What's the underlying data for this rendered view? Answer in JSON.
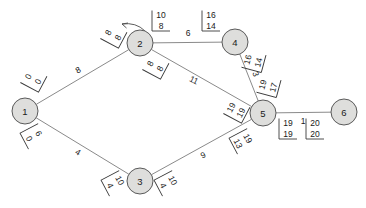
{
  "diagram": {
    "type": "max-flow-network",
    "node_fill": "#dededc",
    "node_stroke": "#5a5a5a",
    "edge_stroke": "#8a8a8a",
    "text_color": "#1a1a1a"
  },
  "nodes": [
    {
      "id": "1",
      "label": "1",
      "x": 25,
      "y": 111,
      "r": 13
    },
    {
      "id": "2",
      "label": "2",
      "x": 140,
      "y": 43,
      "r": 13
    },
    {
      "id": "3",
      "label": "3",
      "x": 140,
      "y": 181,
      "r": 13
    },
    {
      "id": "4",
      "label": "4",
      "x": 235,
      "y": 42,
      "r": 13
    },
    {
      "id": "5",
      "label": "5",
      "x": 263,
      "y": 113,
      "r": 13
    },
    {
      "id": "6",
      "label": "6",
      "x": 344,
      "y": 112,
      "r": 13
    }
  ],
  "edges": [
    {
      "from": "1",
      "to": "2",
      "weight": "8",
      "weight_x": 78,
      "weight_y": 70,
      "weight_rot": -30
    },
    {
      "from": "1",
      "to": "3",
      "weight": "4",
      "weight_x": 78,
      "weight_y": 152,
      "weight_rot": 30
    },
    {
      "from": "2",
      "to": "4",
      "weight": "6",
      "weight_x": 188,
      "weight_y": 33,
      "weight_rot": 0
    },
    {
      "from": "2",
      "to": "5",
      "weight": "11",
      "weight_x": 194,
      "weight_y": 80,
      "weight_rot": 27
    },
    {
      "from": "3",
      "to": "5",
      "weight": "9",
      "weight_x": 203,
      "weight_y": 155,
      "weight_rot": -26
    },
    {
      "from": "4",
      "to": "5",
      "weight": "3",
      "weight_x": 256,
      "weight_y": 74,
      "weight_rot": 70
    },
    {
      "from": "5",
      "to": "6",
      "weight": "1",
      "weight_x": 303,
      "weight_y": 121,
      "weight_rot": 0
    }
  ],
  "flow_labels": [
    {
      "id": "n1-e12",
      "capacity": "0",
      "flow": "0",
      "x": 33,
      "y": 79,
      "rot": -62
    },
    {
      "id": "n2-e12",
      "capacity": "8",
      "flow": "8",
      "x": 113,
      "y": 35,
      "rot": -62
    },
    {
      "id": "n2-e24",
      "capacity": "10",
      "flow": "8",
      "x": 161,
      "y": 20,
      "rot": 0
    },
    {
      "id": "n4-e24",
      "capacity": "16",
      "flow": "14",
      "x": 211,
      "y": 20,
      "rot": 0
    },
    {
      "id": "n2-e25",
      "capacity": "8",
      "flow": "8",
      "x": 155,
      "y": 66,
      "rot": -62
    },
    {
      "id": "n5-e25",
      "capacity": "19",
      "flow": "19",
      "x": 236,
      "y": 110,
      "rot": -62
    },
    {
      "id": "n4-e45",
      "capacity": "16",
      "flow": "14",
      "x": 253,
      "y": 61,
      "rot": -75
    },
    {
      "id": "n5-e45",
      "capacity": "19",
      "flow": "17",
      "x": 268,
      "y": 86,
      "rot": -75
    },
    {
      "id": "n1-e13",
      "capacity": "6",
      "flow": "0",
      "x": 34,
      "y": 136,
      "rot": 62
    },
    {
      "id": "n3-e13",
      "capacity": "10",
      "flow": "4",
      "x": 115,
      "y": 183,
      "rot": 62
    },
    {
      "id": "n3-e35",
      "capacity": "10",
      "flow": "4",
      "x": 168,
      "y": 183,
      "rot": 62
    },
    {
      "id": "n5-e35",
      "capacity": "19",
      "flow": "13",
      "x": 243,
      "y": 141,
      "rot": 62
    },
    {
      "id": "n5-e56",
      "capacity": "19",
      "flow": "19",
      "x": 288,
      "y": 128,
      "rot": 0
    },
    {
      "id": "n6-e56",
      "capacity": "20",
      "flow": "20",
      "x": 315,
      "y": 128,
      "rot": 0
    }
  ],
  "arrow": {
    "name": "flow-direction-arrow",
    "x": 122,
    "y": 24
  }
}
